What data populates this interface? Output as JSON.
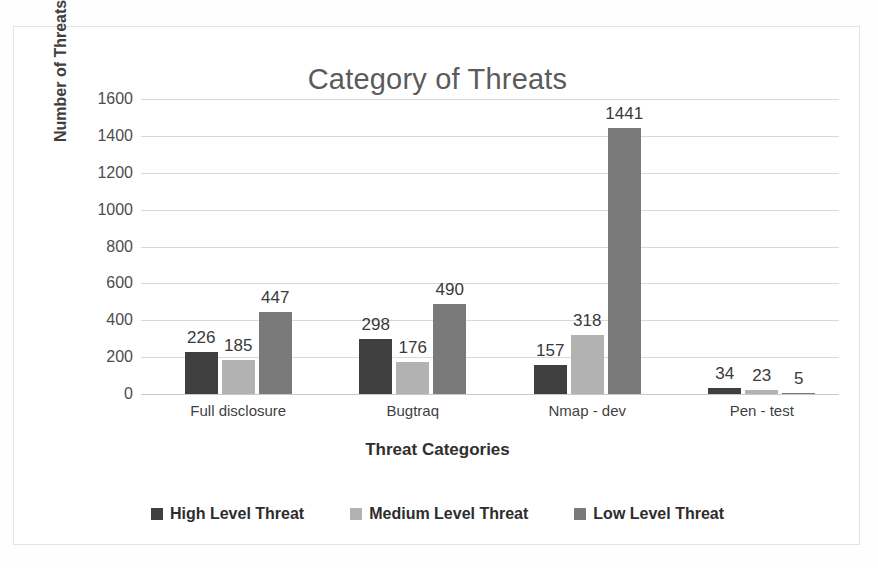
{
  "chart_data": {
    "type": "bar",
    "title": "Category of Threats",
    "xlabel": "Threat Categories",
    "ylabel": "Number of Threats",
    "categories": [
      "Full disclosure",
      "Bugtraq",
      "Nmap - dev",
      "Pen - test"
    ],
    "series": [
      {
        "name": "High Level Threat",
        "color": "#3f3f3f",
        "values": [
          226,
          298,
          157,
          34
        ]
      },
      {
        "name": "Medium Level Threat",
        "color": "#b2b2b2",
        "values": [
          185,
          176,
          318,
          23
        ]
      },
      {
        "name": "Low Level Threat",
        "color": "#7a7a7a",
        "values": [
          447,
          490,
          1441,
          5
        ]
      }
    ],
    "ylim": [
      0,
      1600
    ],
    "yticks": [
      1600,
      1400,
      1200,
      1000,
      800,
      600,
      400,
      200,
      0
    ],
    "grid": true,
    "legend_position": "bottom",
    "data_labels": true
  },
  "colors": {
    "title": "#5b5b5b",
    "gridline": "#d9d9d9",
    "frame_border": "#e3e3e3",
    "background": "#ffffff"
  }
}
